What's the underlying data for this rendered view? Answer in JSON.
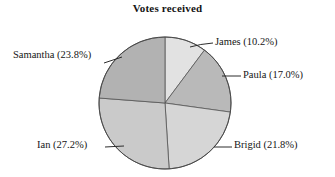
{
  "chart_data": {
    "type": "pie",
    "title": "Votes received",
    "xlabel": "",
    "ylabel": "",
    "legend_position": "none",
    "grid": false,
    "start_angle_deg": 0,
    "direction": "clockwise",
    "categories": [
      "James",
      "Paula",
      "Brigid",
      "Ian",
      "Samantha"
    ],
    "values": [
      10.2,
      17.0,
      21.8,
      27.2,
      23.8
    ],
    "unit": "%",
    "labels": [
      "James (10.2%)",
      "Paula (17.0%)",
      "Brigid (21.8%)",
      "Ian (27.2%)",
      "Samantha (23.8%)"
    ],
    "slices": [
      {
        "name": "James",
        "label": "James (10.2%)",
        "value": 10.2,
        "color": "#e2e2e2"
      },
      {
        "name": "Paula",
        "label": "Paula (17.0%)",
        "value": 17.0,
        "color": "#b9b9b9"
      },
      {
        "name": "Brigid",
        "label": "Brigid (21.8%)",
        "value": 21.8,
        "color": "#d6d6d6"
      },
      {
        "name": "Ian",
        "label": "Ian (27.2%)",
        "value": 27.2,
        "color": "#cacaca"
      },
      {
        "name": "Samantha",
        "label": "Samantha (23.8%)",
        "value": 23.8,
        "color": "#b2b2b2"
      }
    ],
    "colors": {
      "background": "#ffffff",
      "outline": "#555555",
      "text": "#161616",
      "leader_line": "#333333"
    }
  }
}
